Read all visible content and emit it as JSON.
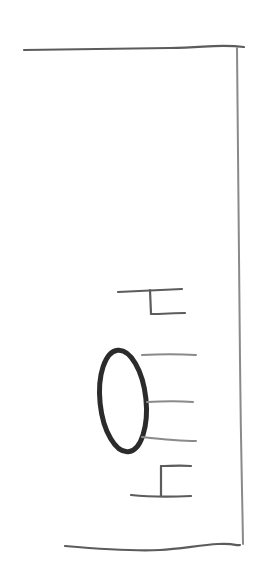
{
  "sketch": {
    "kind": "hand-drawn wireframe (rotated 90°)",
    "colors": {
      "paper": "#ffffff",
      "pencil_light": "#8a8a8a",
      "pencil_mid": "#5c5c5c",
      "pencil_dark": "#2b2b2b"
    },
    "elements": {
      "frame": [
        "top-edge",
        "right-edge",
        "bottom-edge"
      ],
      "avatar": "oval placeholder",
      "text_lines": 3,
      "brackets": 2
    }
  }
}
